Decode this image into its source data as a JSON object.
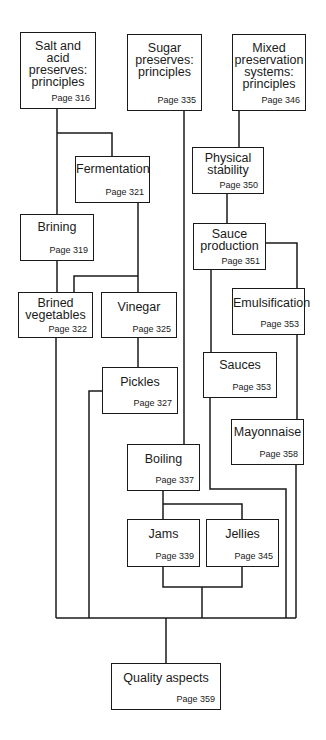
{
  "diagram": {
    "type": "flowchart",
    "nodes": [
      {
        "id": "salt",
        "title": "Salt and\nacid\npreserves:\nprinciples",
        "page": "Page 316"
      },
      {
        "id": "sugar",
        "title": "Sugar\npreserves:\nprinciples",
        "page": "Page 335"
      },
      {
        "id": "mixed",
        "title": "Mixed\npreservation\nsystems:\nprinciples",
        "page": "Page 346"
      },
      {
        "id": "fermentation",
        "title": "Fermentation",
        "page": "Page 321"
      },
      {
        "id": "physical",
        "title": "Physical\nstability",
        "page": "Page 350"
      },
      {
        "id": "brining",
        "title": "Brining",
        "page": "Page 319"
      },
      {
        "id": "sauce_production",
        "title": "Sauce\nproduction",
        "page": "Page 351"
      },
      {
        "id": "brined_veg",
        "title": "Brined\nvegetables",
        "page": "Page 322"
      },
      {
        "id": "vinegar",
        "title": "Vinegar",
        "page": "Page 325"
      },
      {
        "id": "emulsification",
        "title": "Emulsification",
        "page": "Page 353"
      },
      {
        "id": "pickles",
        "title": "Pickles",
        "page": "Page 327"
      },
      {
        "id": "sauces",
        "title": "Sauces",
        "page": "Page 353"
      },
      {
        "id": "mayonnaise",
        "title": "Mayonnaise",
        "page": "Page 358"
      },
      {
        "id": "boiling",
        "title": "Boiling",
        "page": "Page 337"
      },
      {
        "id": "jams",
        "title": "Jams",
        "page": "Page 339"
      },
      {
        "id": "jellies",
        "title": "Jellies",
        "page": "Page 345"
      },
      {
        "id": "quality",
        "title": "Quality aspects",
        "page": "Page 359"
      }
    ],
    "edges": [
      [
        "salt",
        "fermentation"
      ],
      [
        "salt",
        "brining"
      ],
      [
        "fermentation",
        "brined_veg"
      ],
      [
        "fermentation",
        "vinegar"
      ],
      [
        "brining",
        "brined_veg"
      ],
      [
        "vinegar",
        "pickles"
      ],
      [
        "sugar",
        "boiling"
      ],
      [
        "boiling",
        "jams"
      ],
      [
        "boiling",
        "jellies"
      ],
      [
        "mixed",
        "physical"
      ],
      [
        "physical",
        "sauce_production"
      ],
      [
        "sauce_production",
        "sauces"
      ],
      [
        "sauce_production",
        "emulsification"
      ],
      [
        "emulsification",
        "mayonnaise"
      ],
      [
        "brined_veg",
        "quality"
      ],
      [
        "pickles",
        "quality"
      ],
      [
        "jams",
        "quality"
      ],
      [
        "jellies",
        "quality"
      ],
      [
        "sauces",
        "quality"
      ],
      [
        "mayonnaise",
        "quality"
      ]
    ]
  }
}
